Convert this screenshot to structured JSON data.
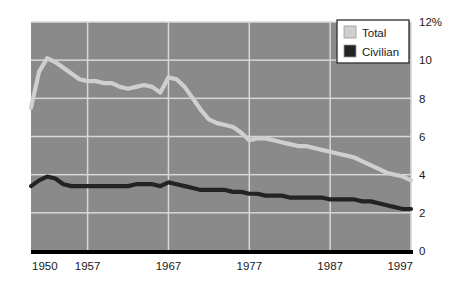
{
  "chart_data": {
    "type": "line",
    "title": "",
    "subtitle": "",
    "xlabel": "",
    "ylabel": "",
    "xlim": [
      1950,
      1997
    ],
    "ylim": [
      0,
      12
    ],
    "grid": true,
    "legend_position": "top-right",
    "x_tick_labels": [
      "1950",
      "1957",
      "1967",
      "1977",
      "1987",
      "1997"
    ],
    "x_tick_values": [
      1950,
      1957,
      1967,
      1977,
      1987,
      1997
    ],
    "y_tick_labels": [
      "12%",
      "10",
      "8",
      "6",
      "4",
      "2",
      "0"
    ],
    "y_tick_values": [
      12,
      10,
      8,
      6,
      4,
      2,
      0
    ],
    "x": [
      1950,
      1951,
      1952,
      1953,
      1954,
      1955,
      1956,
      1957,
      1958,
      1959,
      1960,
      1961,
      1962,
      1963,
      1964,
      1965,
      1966,
      1967,
      1968,
      1969,
      1970,
      1971,
      1972,
      1973,
      1974,
      1975,
      1976,
      1977,
      1978,
      1979,
      1980,
      1981,
      1982,
      1983,
      1984,
      1985,
      1986,
      1987,
      1988,
      1989,
      1990,
      1991,
      1992,
      1993,
      1994,
      1995,
      1996,
      1997
    ],
    "series": [
      {
        "name": "Total",
        "color": "#cfcfcf",
        "values": [
          7.5,
          9.4,
          10.1,
          9.9,
          9.6,
          9.3,
          9.0,
          8.9,
          8.9,
          8.8,
          8.8,
          8.6,
          8.5,
          8.6,
          8.7,
          8.6,
          8.3,
          9.1,
          9.0,
          8.6,
          8.0,
          7.4,
          6.9,
          6.7,
          6.6,
          6.5,
          6.2,
          5.8,
          5.9,
          5.9,
          5.8,
          5.7,
          5.6,
          5.5,
          5.5,
          5.4,
          5.3,
          5.2,
          5.1,
          5.0,
          4.9,
          4.7,
          4.5,
          4.3,
          4.1,
          4.0,
          3.9,
          3.7
        ]
      },
      {
        "name": "Civilian",
        "color": "#232323",
        "values": [
          3.4,
          3.7,
          3.9,
          3.8,
          3.5,
          3.4,
          3.4,
          3.4,
          3.4,
          3.4,
          3.4,
          3.4,
          3.4,
          3.5,
          3.5,
          3.5,
          3.4,
          3.6,
          3.5,
          3.4,
          3.3,
          3.2,
          3.2,
          3.2,
          3.2,
          3.1,
          3.1,
          3.0,
          3.0,
          2.9,
          2.9,
          2.9,
          2.8,
          2.8,
          2.8,
          2.8,
          2.8,
          2.7,
          2.7,
          2.7,
          2.7,
          2.6,
          2.6,
          2.5,
          2.4,
          2.3,
          2.2,
          2.2
        ]
      }
    ],
    "legend": [
      {
        "label": "Total",
        "swatch_color": "#cfcfcf"
      },
      {
        "label": "Civilian",
        "swatch_color": "#232323"
      }
    ],
    "colors": {
      "plot_background": "#8a8a8a",
      "gridline": "#d8d8d8",
      "axis_line": "#000000",
      "legend_background": "#ffffff",
      "legend_border": "#3a3a3a",
      "page_background": "#ffffff",
      "tick_label": "#1a1a1a"
    }
  }
}
